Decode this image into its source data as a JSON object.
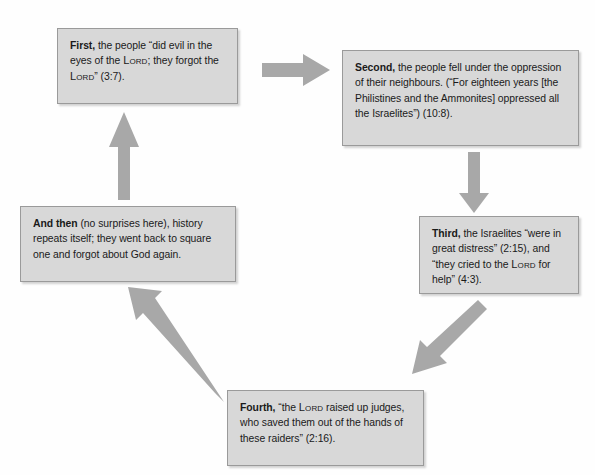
{
  "diagram": {
    "type": "cycle-flowchart",
    "colors": {
      "box_fill": "#d8d8d8",
      "box_border": "#9a9a9a",
      "arrow_fill": "#a8a8a8",
      "page_background": "#fefefe",
      "text": "#1a1a1a"
    },
    "nodes": [
      {
        "id": "first",
        "name": "node-first",
        "lead": "First,",
        "body": " the people “did evil in the eyes of the ",
        "sc1": "Lord",
        "body2": "; they forgot the ",
        "sc2": "Lord",
        "body3": "” (3:7).",
        "plain_text": "First, the people “did evil in the eyes of the Lord; they forgot the Lord” (3:7)."
      },
      {
        "id": "second",
        "name": "node-second",
        "lead": "Second,",
        "body": " the people fell under the oppression of their neighbours. (“For eighteen years [the Philistines and the Ammonites] oppressed all the Israelites”) (10:8).",
        "plain_text": "Second, the people fell under the oppression of their neighbours. (“For eighteen years [the Philistines and the Ammonites] oppressed all the Israelites”) (10:8)."
      },
      {
        "id": "third",
        "name": "node-third",
        "lead": "Third,",
        "body": " the Israelites “were in great distress” (2:15), and “they cried to the ",
        "sc1": "Lord",
        "body2": " for help” (4:3).",
        "plain_text": "Third, the Israelites “were in great distress” (2:15), and “they cried to the Lord for help” (4:3)."
      },
      {
        "id": "fourth",
        "name": "node-fourth",
        "lead": "Fourth,",
        "body": " “the ",
        "sc1": "Lord",
        "body2": " raised up judges, who saved them out of the hands of these raiders” (2:16).",
        "plain_text": "Fourth, “the Lord raised up judges, who saved them out of the hands of these raiders” (2:16)."
      },
      {
        "id": "andthen",
        "name": "node-and-then",
        "lead": "And then",
        "body": " (no surprises here), history repeats itself; they went back to square one and forgot about God again.",
        "plain_text": "And then (no surprises here), history repeats itself; they went back to square one and forgot about God again."
      }
    ],
    "arrows": [
      {
        "id": "first-to-second",
        "direction": "right",
        "from": "first",
        "to": "second"
      },
      {
        "id": "second-to-third",
        "direction": "down",
        "from": "second",
        "to": "third"
      },
      {
        "id": "third-to-fourth",
        "direction": "down-left",
        "from": "third",
        "to": "fourth"
      },
      {
        "id": "fourth-to-andthen",
        "direction": "up-left",
        "from": "fourth",
        "to": "andthen"
      },
      {
        "id": "andthen-to-first",
        "direction": "up",
        "from": "andthen",
        "to": "first"
      }
    ]
  }
}
